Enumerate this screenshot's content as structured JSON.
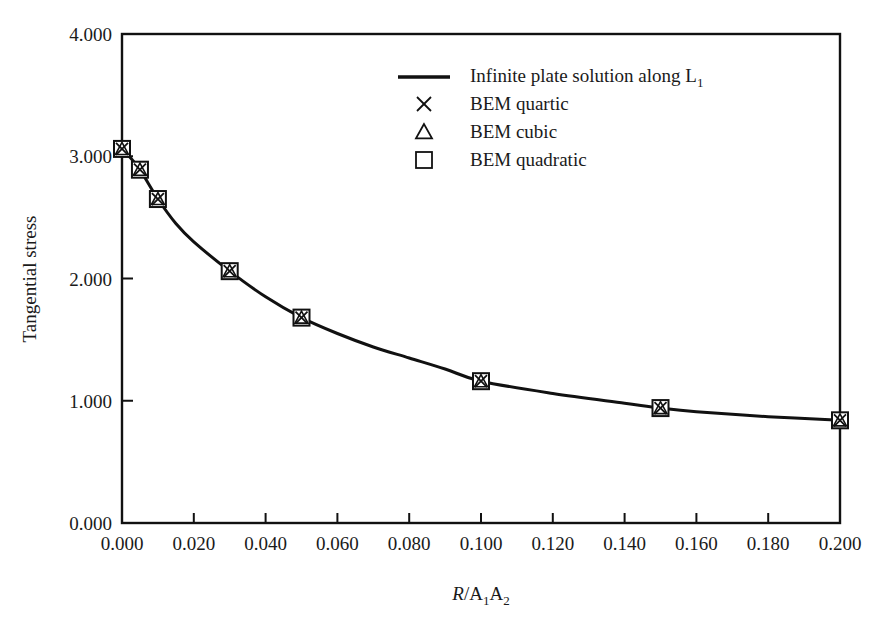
{
  "chart_data": {
    "type": "line",
    "title": "",
    "xlabel": "R/A1A2",
    "xlabel_parts": {
      "italic": "R",
      "rest": "/A",
      "sub1": "1",
      "mid": "A",
      "sub2": "2"
    },
    "ylabel": "Tangential stress",
    "xlim": [
      0.0,
      0.2
    ],
    "ylim": [
      0.0,
      4.0
    ],
    "grid": false,
    "legend_position": "top-right-inside",
    "xticks": [
      "0.000",
      "0.020",
      "0.040",
      "0.060",
      "0.080",
      "0.100",
      "0.120",
      "0.140",
      "0.160",
      "0.180",
      "0.200"
    ],
    "xtick_values": [
      0.0,
      0.02,
      0.04,
      0.06,
      0.08,
      0.1,
      0.12,
      0.14,
      0.16,
      0.18,
      0.2
    ],
    "yticks": [
      "0.000",
      "1.000",
      "2.000",
      "3.000",
      "4.000"
    ],
    "ytick_values": [
      0.0,
      1.0,
      2.0,
      3.0,
      4.0
    ],
    "series": [
      {
        "name": "Infinite plate solution along L1",
        "marker": "line",
        "x": [
          0.0,
          0.002,
          0.005,
          0.01,
          0.015,
          0.02,
          0.03,
          0.04,
          0.05,
          0.06,
          0.07,
          0.08,
          0.09,
          0.1,
          0.12,
          0.14,
          0.15,
          0.16,
          0.18,
          0.2
        ],
        "values": [
          3.06,
          3.0,
          2.89,
          2.65,
          2.45,
          2.3,
          2.06,
          1.85,
          1.68,
          1.55,
          1.44,
          1.35,
          1.26,
          1.16,
          1.06,
          0.98,
          0.94,
          0.91,
          0.87,
          0.84
        ]
      },
      {
        "name": "BEM quartic",
        "marker": "x",
        "x": [
          0.0,
          0.005,
          0.01,
          0.03,
          0.05,
          0.1,
          0.15,
          0.2
        ],
        "values": [
          3.06,
          2.89,
          2.65,
          2.06,
          1.68,
          1.16,
          0.94,
          0.84
        ]
      },
      {
        "name": "BEM cubic",
        "marker": "triangle",
        "x": [
          0.0,
          0.005,
          0.01,
          0.03,
          0.05,
          0.1,
          0.15,
          0.2
        ],
        "values": [
          3.06,
          2.89,
          2.65,
          2.06,
          1.68,
          1.16,
          0.94,
          0.84
        ]
      },
      {
        "name": "BEM quadratic",
        "marker": "square",
        "x": [
          0.0,
          0.005,
          0.01,
          0.03,
          0.05,
          0.1,
          0.15,
          0.2
        ],
        "values": [
          3.06,
          2.89,
          2.65,
          2.06,
          1.68,
          1.16,
          0.94,
          0.84
        ]
      }
    ],
    "legend": [
      {
        "label": "Infinite plate solution along L",
        "sub": "1",
        "marker": "line"
      },
      {
        "label": "BEM quartic",
        "sub": "",
        "marker": "x"
      },
      {
        "label": "BEM cubic",
        "sub": "",
        "marker": "triangle"
      },
      {
        "label": "BEM quadratic",
        "sub": "",
        "marker": "square"
      }
    ],
    "colors": {
      "line": "#111111",
      "marker": "#111111",
      "background": "#ffffff"
    }
  }
}
